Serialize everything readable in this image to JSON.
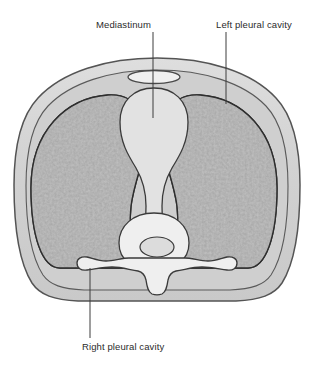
{
  "figure": {
    "type": "anatomical-cross-section",
    "region": "thorax",
    "view": "transverse-section",
    "background_color": "#ffffff"
  },
  "labels": {
    "mediastinum": "Mediastinum",
    "left_pleural_cavity": "Left pleural cavity",
    "right_pleural_cavity": "Right pleural cavity"
  },
  "structures": {
    "body_wall": "body-wall",
    "sternum": "sternum",
    "vertebra": "vertebra",
    "vertebral_body": "vertebral-body",
    "spinal_canal": "spinal-canal",
    "spinous_process": "spinous-process",
    "transverse_process_left": "transverse-process-left",
    "transverse_process_right": "transverse-process-right",
    "lung_left": "left-lung",
    "lung_right": "right-lung",
    "mediastinum_region": "mediastinum-region"
  },
  "colors": {
    "outline": "#4a4a4a",
    "body_wall_fill": "#d3d3d3",
    "pleural_space_fill": "#cfcfcf",
    "lung_fill": "#8f8f8f",
    "lung_texture_dark": "#7d7d7d",
    "lung_texture_light": "#a4a4a4",
    "mediastinum_fill": "#e0e0e0",
    "bone_fill": "#ebebeb",
    "leader_line": "#3c3c3c",
    "text": "#2b2b2b",
    "background": "#ffffff"
  },
  "leader_lines": [
    {
      "name": "mediastinum-leader",
      "x1": 153,
      "y1": 32,
      "x2": 153,
      "y2": 118
    },
    {
      "name": "left-pleural-leader",
      "x1": 226,
      "y1": 32,
      "x2": 226,
      "y2": 104
    },
    {
      "name": "right-pleural-leader",
      "x1": 90,
      "y1": 268,
      "x2": 90,
      "y2": 338
    }
  ]
}
